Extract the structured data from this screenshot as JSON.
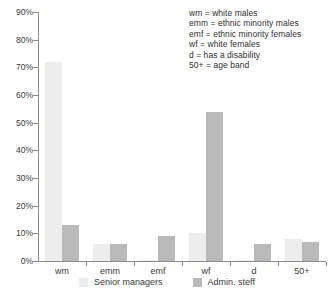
{
  "chart_data": {
    "type": "bar",
    "title": "",
    "xlabel": "",
    "ylabel": "",
    "ylim": [
      0,
      90
    ],
    "grid": false,
    "legend_position": "bottom",
    "categories": [
      "wm",
      "emm",
      "emf",
      "wf",
      "d",
      "50+"
    ],
    "ytick_labels": [
      "0%",
      "10%",
      "20%",
      "30%",
      "40%",
      "50%",
      "60%",
      "70%",
      "80%",
      "90%"
    ],
    "ytick_values": [
      0,
      10,
      20,
      30,
      40,
      50,
      60,
      70,
      80,
      90
    ],
    "series": [
      {
        "name": "Senior managers",
        "color": "#ededed",
        "values": [
          72,
          6,
          0.5,
          10,
          0.5,
          8
        ]
      },
      {
        "name": "Admin. steff",
        "color": "#b9b9b9",
        "values": [
          13,
          6,
          9,
          54,
          6,
          7
        ]
      }
    ],
    "annotations": [
      "wm = white males",
      "emm = ethnic minority males",
      "emf = ethnic minority females",
      "wf = white females",
      "d = has a disability",
      "50+ = age band"
    ]
  },
  "key": {
    "lines": [
      "wm = white males",
      "emm = ethnic minority males",
      "emf = ethnic minority females",
      "wf = white females",
      "d = has a disability",
      "50+ = age band"
    ]
  },
  "legend": {
    "items": [
      {
        "label": "Senior managers",
        "color": "#ededed"
      },
      {
        "label": "Admin. steff",
        "color": "#b9b9b9"
      }
    ]
  }
}
